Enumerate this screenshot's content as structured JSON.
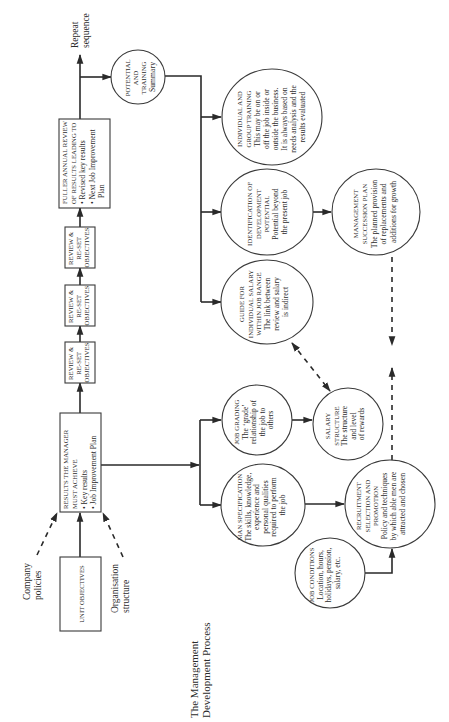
{
  "title": {
    "line1": "The Management",
    "line2": "Development Process"
  },
  "inputs": {
    "company_policies": [
      "Company",
      "policies"
    ],
    "organisation_structure": [
      "Organisation",
      "structure"
    ]
  },
  "boxes": {
    "unit_objectives": "UNIT OBJECTIVES",
    "results": {
      "lines": [
        "RESULTS THE MANAGER",
        "MUST ACHIEVE",
        "• Key results",
        "• Job Improvement Plan"
      ]
    },
    "review": [
      {
        "lines": [
          "REVIEW &",
          "RE-SET",
          "OBJECTIVES"
        ]
      },
      {
        "lines": [
          "REVIEW &",
          "RE-SET",
          "OBJECTIVES"
        ]
      },
      {
        "lines": [
          "REVIEW &",
          "RE-SET",
          "OBJECTIVES"
        ]
      }
    ],
    "fuller_review": {
      "lines": [
        "FULLER ANNUAL REVIEW",
        "OF RESULTS LEADING TO",
        "• Revised key results",
        "• Next Job Improvement",
        "  Plan"
      ]
    }
  },
  "repeat": [
    "Repeat",
    "sequence"
  ],
  "circles": {
    "potential_training": [
      "POTENTIAL",
      "AND",
      "TRAINING",
      "Summary"
    ],
    "individual_training": [
      "INDIVIDUAL AND",
      "GROUP TRAINING",
      "This may be on or",
      "off the job inside or",
      "outside the business.",
      "It is always based on",
      "needs analysis and the",
      "results evaluated"
    ],
    "identification": [
      "IDENTIFICATION OF",
      "DEVELOPMENT",
      "POTENTIAL",
      "Potential beyond",
      "the present job"
    ],
    "succession": [
      "MANAGEMENT",
      "SUCCESSION PLAN",
      "The planned provision",
      "of replacements and",
      "additions for growth"
    ],
    "guide_salary": [
      "GUIDE FOR",
      "INDIVIDUAL SALARY",
      "WITHIN JOB RANGE",
      "The link between",
      "review and salary",
      "is indirect"
    ],
    "job_grading": [
      "JOB GRADING",
      "The ‘grade’",
      "relationship of",
      "the job to",
      "others"
    ],
    "salary_structure": [
      "SALARY",
      "STRUCTURE",
      "The structure",
      "and level",
      "of rewards"
    ],
    "man_specification": [
      "MAN SPECIFICATION",
      "The skills, knowledge,",
      "experience and",
      "personal qualities",
      "required to perform",
      "the job"
    ],
    "recruitment": [
      "RECRUITMENT",
      "SELECTION AND",
      "PROMOTION",
      "Policy and techniques",
      "by which able men are",
      "attracted and chosen"
    ],
    "job_conditions": [
      "JOB CONDITIONS",
      "Location, hours,",
      "holidays, pension,",
      "salary, etc."
    ]
  },
  "colors": {
    "line": "#2a2a2a",
    "text": "#2b2b2b",
    "background": "#ffffff"
  }
}
